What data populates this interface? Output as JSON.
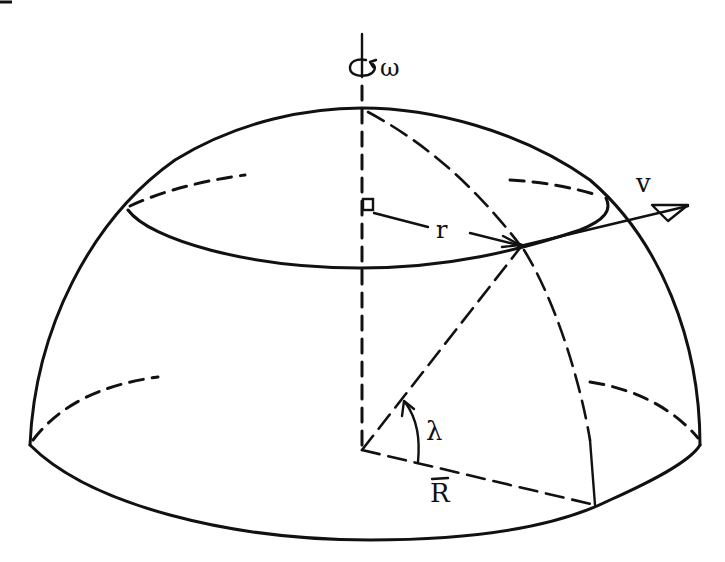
{
  "diagram": {
    "labels": {
      "angular_velocity": "ω",
      "latitude_radius": "r",
      "velocity": "v",
      "latitude_angle": "λ",
      "sphere_radius": "R"
    },
    "elements": [
      "rotation-axis",
      "hemisphere-outline",
      "equator-ellipse",
      "latitude-circle",
      "meridian-arc",
      "radius-r-arrow",
      "velocity-v-arrow",
      "radius-R-line",
      "angle-lambda-arc",
      "right-angle-marker"
    ],
    "stroke_color": "#111111",
    "background_color": "#ffffff"
  }
}
